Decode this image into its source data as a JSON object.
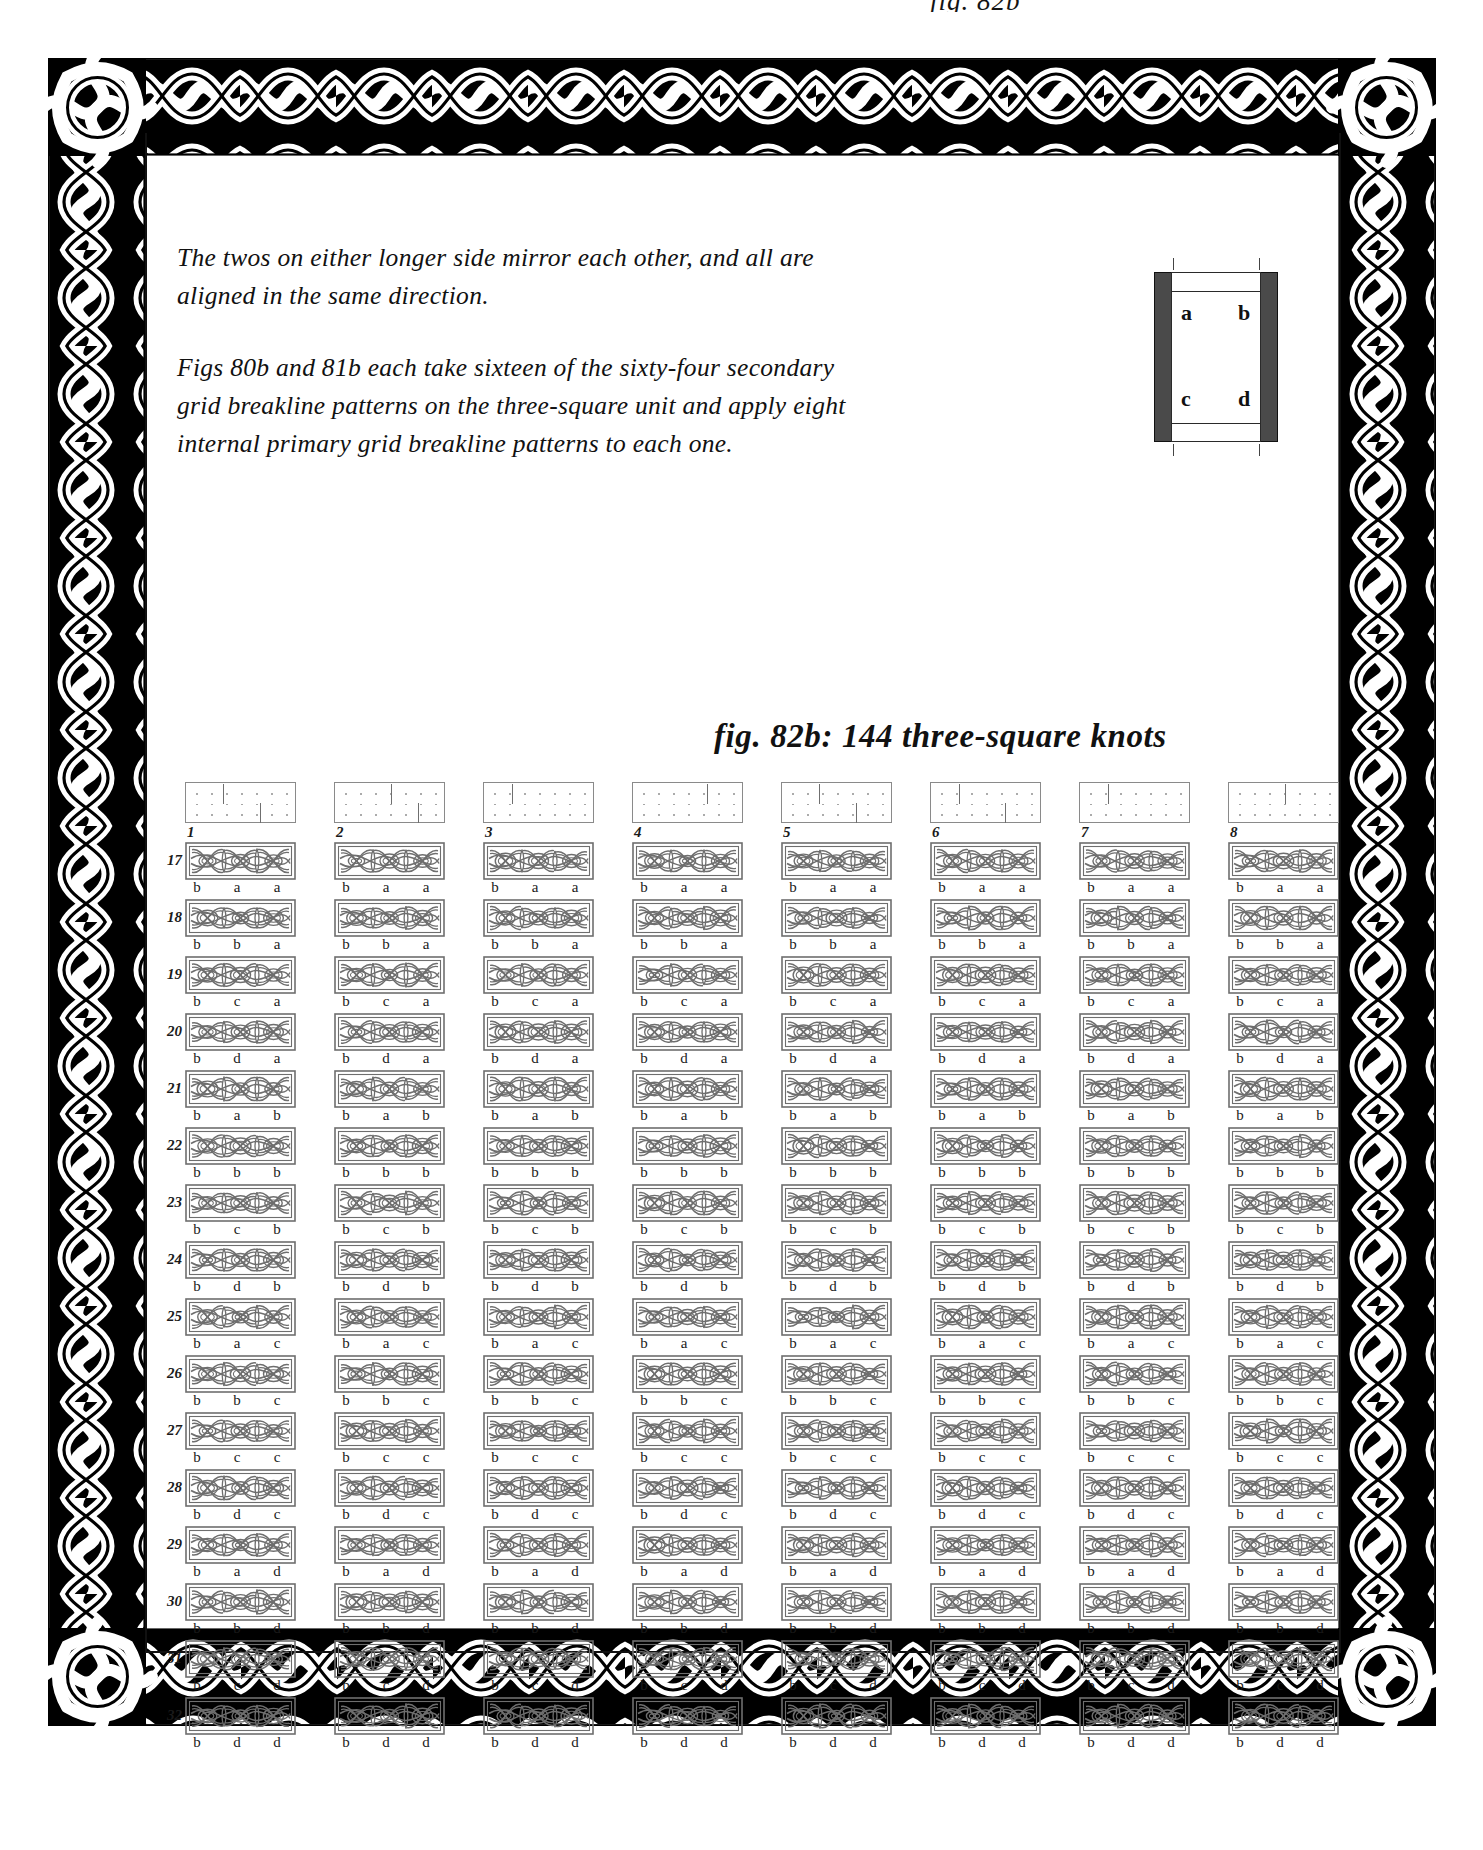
{
  "running_head": "fig. 82b",
  "body": {
    "paragraphs": [
      "The twos on either longer side mirror each other, and all are aligned in the same direction.",
      "Figs 80b and 81b each take sixteen of the sixty-four secondary grid breakline patterns on the three-square unit and apply eight internal primary grid breakline patterns to each one."
    ]
  },
  "key_diagram": {
    "name": "three-square-unit-key",
    "labels": [
      "a",
      "b",
      "c",
      "d"
    ],
    "bar_color": "#4a4a4a",
    "line_color": "#2a2a2a"
  },
  "figure": {
    "caption": "fig. 82b: 144 three-square knots",
    "count": 144,
    "columns": 8,
    "rows": 16
  },
  "grid": {
    "column_headers": [
      {
        "number": "1",
        "breaks": [
          0.333,
          0.666
        ]
      },
      {
        "number": "2",
        "breaks": [
          0.5,
          0.75
        ]
      },
      {
        "number": "3",
        "breaks": [
          0.25
        ]
      },
      {
        "number": "4",
        "breaks": [
          0.666
        ]
      },
      {
        "number": "5",
        "breaks": [
          0.333,
          0.666
        ]
      },
      {
        "number": "6",
        "breaks": [
          0.25,
          0.666
        ]
      },
      {
        "number": "7",
        "breaks": [
          0.25
        ]
      },
      {
        "number": "8",
        "breaks": [
          0.5
        ]
      }
    ],
    "row_numbers": [
      "17",
      "18",
      "19",
      "20",
      "21",
      "22",
      "23",
      "24",
      "25",
      "26",
      "27",
      "28",
      "29",
      "30",
      "31",
      "32"
    ],
    "row_letters": [
      [
        "b",
        "a",
        "a"
      ],
      [
        "b",
        "b",
        "a"
      ],
      [
        "b",
        "c",
        "a"
      ],
      [
        "b",
        "d",
        "a"
      ],
      [
        "b",
        "a",
        "b"
      ],
      [
        "b",
        "b",
        "b"
      ],
      [
        "b",
        "c",
        "b"
      ],
      [
        "b",
        "d",
        "b"
      ],
      [
        "b",
        "a",
        "c"
      ],
      [
        "b",
        "b",
        "c"
      ],
      [
        "b",
        "c",
        "c"
      ],
      [
        "b",
        "d",
        "c"
      ],
      [
        "b",
        "a",
        "d"
      ],
      [
        "b",
        "b",
        "d"
      ],
      [
        "b",
        "c",
        "d"
      ],
      [
        "b",
        "d",
        "d"
      ]
    ],
    "ink_color": "#6e6e6e",
    "label_color": "#1a1a1a"
  }
}
